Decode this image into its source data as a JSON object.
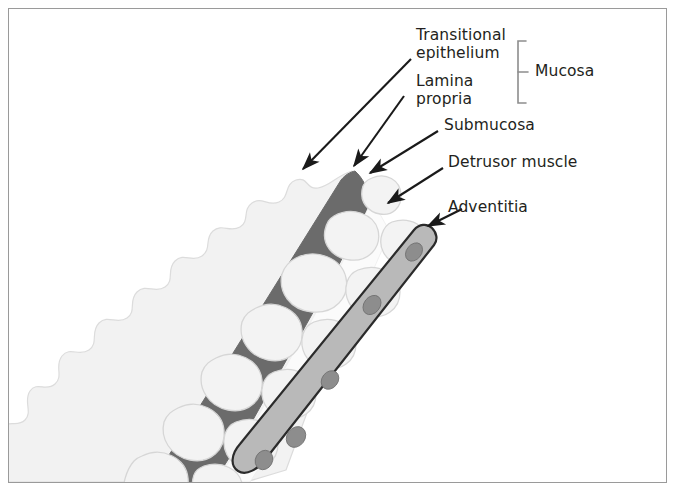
{
  "figure": {
    "type": "labeled-histology-diagram",
    "border_color": "#9a9a9a",
    "background_color": "#ffffff",
    "text_color": "#231f20"
  },
  "labels": {
    "transitional_epithelium": "Transitional\nepithelium",
    "lamina_propria": "Lamina\npropria",
    "mucosa": "Mucosa",
    "submucosa": "Submucosa",
    "detrusor_muscle": "Detrusor muscle",
    "adventitia": "Adventitia"
  },
  "layers": [
    {
      "name": "transitional-epithelium",
      "label": "Transitional epithelium",
      "color": "#f0f0f0",
      "stroke": "#d8d8d8",
      "description": "pale scalloped lobed innermost lining"
    },
    {
      "name": "lamina-propria",
      "label": "Lamina propria",
      "color": "#6b6b6b",
      "stroke": "#6b6b6b",
      "description": "dark grey band beneath epithelium"
    },
    {
      "name": "submucosa",
      "label": "Submucosa",
      "color": "#fbfbfb",
      "stroke": "#e2e2e2",
      "description": "pale zone between lamina propria and muscle"
    },
    {
      "name": "detrusor-muscle",
      "label": "Detrusor muscle",
      "color": "#f2f2f2",
      "stroke": "#d5d5d5",
      "description": "rounded pale muscle bundles in cross-section"
    },
    {
      "name": "adventitia",
      "label": "Adventitia",
      "color": "#b8b8b8",
      "stroke": "#2a2a2a",
      "nucleus_color": "#8e8e8e",
      "description": "tapering outer band with grey oval nuclei"
    }
  ],
  "bracket": {
    "name": "mucosa-bracket",
    "groups": [
      "Transitional epithelium",
      "Lamina propria"
    ],
    "label": "Mucosa",
    "color": "#8d8d8d"
  },
  "arrows": {
    "color": "#1a1a1a",
    "items": [
      {
        "name": "arrow-transitional-epithelium",
        "from": [
          411,
          59
        ],
        "to": [
          299,
          173
        ]
      },
      {
        "name": "arrow-lamina-propria",
        "from": [
          404,
          96
        ],
        "to": [
          351,
          170
        ]
      },
      {
        "name": "arrow-submucosa",
        "from": [
          438,
          131
        ],
        "to": [
          366,
          176
        ]
      },
      {
        "name": "arrow-detrusor-muscle",
        "from": [
          443,
          168
        ],
        "to": [
          384,
          206
        ]
      },
      {
        "name": "arrow-adventitia",
        "from": [
          462,
          209
        ],
        "to": [
          424,
          228
        ]
      }
    ]
  }
}
